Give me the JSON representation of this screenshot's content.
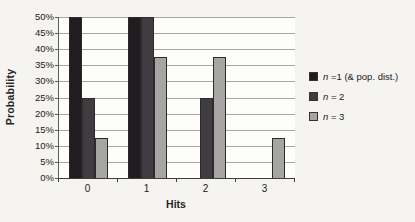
{
  "chart_data": {
    "type": "bar",
    "title": "",
    "xlabel": "Hits",
    "ylabel": "Probability",
    "categories": [
      "0",
      "1",
      "2",
      "3"
    ],
    "series": [
      {
        "label": "n =1 (& pop. dist.)",
        "legend_var": "n",
        "legend_rest": " =1 (& pop. dist.)",
        "color": "#201c20",
        "values": [
          50,
          50,
          0,
          0
        ]
      },
      {
        "label": "n = 2",
        "legend_var": "n",
        "legend_rest": " = 2",
        "color": "#413c42",
        "values": [
          25,
          50,
          25,
          0
        ]
      },
      {
        "label": "n = 3",
        "legend_var": "n",
        "legend_rest": " = 3",
        "color": "#a7a5a3",
        "values": [
          12.5,
          37.5,
          37.5,
          12.5
        ]
      }
    ],
    "yticks": [
      "50%",
      "45%",
      "40%",
      "35%",
      "30%",
      "25%",
      "20%",
      "15%",
      "10%",
      "5%",
      "0%"
    ],
    "ytick_values": [
      50,
      45,
      40,
      35,
      30,
      25,
      20,
      15,
      10,
      5,
      0
    ],
    "ylim": [
      0,
      50
    ],
    "grid": true,
    "legend_position": "right",
    "colors": {
      "background": "#f5f4f0",
      "plot_background": "#fdfdfa",
      "gridline": "#a8a6a1",
      "axis": "#3d3d3d",
      "text": "#242424"
    }
  }
}
